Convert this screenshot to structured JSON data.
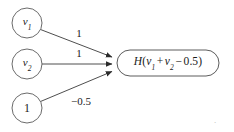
{
  "figure": {
    "type": "neural-unit-diagram",
    "background_color": "#ffffff",
    "stroke_color": "#2b2b2b",
    "text_color": "#1a1a1a",
    "trailing_mark": "."
  },
  "nodes": [
    {
      "id": "v1",
      "label_base": "v",
      "label_sub": "1",
      "label_plain": "v1",
      "shape": "circle",
      "cx": 27,
      "cy": 23,
      "r": 15
    },
    {
      "id": "v2",
      "label_base": "v",
      "label_sub": "2",
      "label_plain": "v2",
      "shape": "circle",
      "cx": 27,
      "cy": 64,
      "r": 15
    },
    {
      "id": "bias",
      "label_base": "1",
      "label_sub": "",
      "label_plain": "1",
      "shape": "circle",
      "cx": 27,
      "cy": 108,
      "r": 15
    }
  ],
  "output": {
    "id": "output",
    "shape": "rounded-rect",
    "function_name": "H",
    "expression_plain": "H(v1 + v2 - 0.5)",
    "parts": {
      "open": "(",
      "term1_base": "v",
      "term1_sub": "1",
      "op1": "+",
      "term2_base": "v",
      "term2_sub": "2",
      "op2": "−",
      "term3": "0.5",
      "close": ")"
    },
    "x": 117,
    "y": 50,
    "width": 102,
    "height": 26
  },
  "edges": [
    {
      "id": "edge-v1",
      "from": "v1",
      "to": "output",
      "weight_label": "1",
      "label_x": 79,
      "label_y": 33
    },
    {
      "id": "edge-v2",
      "from": "v2",
      "to": "output",
      "weight_label": "1",
      "label_x": 79,
      "label_y": 53
    },
    {
      "id": "edge-bias",
      "from": "bias",
      "to": "output",
      "weight_label": "−0.5",
      "label_x": 81,
      "label_y": 101
    }
  ]
}
